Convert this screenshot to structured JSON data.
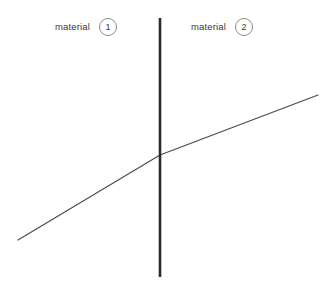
{
  "figure": {
    "width": 327,
    "height": 301,
    "background_color": "#ffffff"
  },
  "labels": [
    {
      "text": "material",
      "badge": "1",
      "region": "left"
    },
    {
      "text": "material",
      "badge": "2",
      "region": "right"
    }
  ],
  "colors": {
    "interface_line": "#2b2b2b",
    "profile_line": "#4a4a4a",
    "badge_border": "#8c8c8c",
    "text": "#3a3a3a"
  },
  "chart_data": {
    "type": "line",
    "title": "",
    "xlabel": "",
    "ylabel": "",
    "grid": false,
    "legend": "none",
    "annotations": [
      {
        "label": "material 1",
        "x": 114,
        "y": 27
      },
      {
        "label": "material 2",
        "x": 254,
        "y": 27
      }
    ],
    "series": [
      {
        "name": "interface",
        "type": "vertical-line",
        "stroke": "#2b2b2b",
        "stroke_width": 2.6,
        "points": [
          [
            160,
            18
          ],
          [
            160,
            277
          ]
        ]
      },
      {
        "name": "profile-material-1",
        "type": "segment",
        "stroke": "#4a4a4a",
        "stroke_width": 1.2,
        "points": [
          [
            18,
            240
          ],
          [
            160,
            155
          ]
        ]
      },
      {
        "name": "profile-material-2",
        "type": "segment",
        "stroke": "#4a4a4a",
        "stroke_width": 1.2,
        "points": [
          [
            160,
            155
          ],
          [
            318,
            95
          ]
        ]
      }
    ],
    "interface_x": 160,
    "intersection": [
      160,
      155
    ],
    "xlim": [
      0,
      327
    ],
    "ylim": [
      301,
      0
    ]
  }
}
